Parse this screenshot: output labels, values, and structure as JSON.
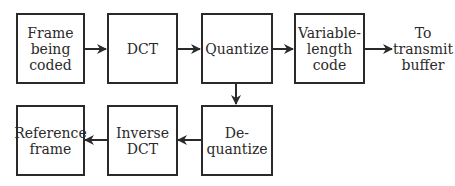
{
  "diagram": {
    "title": "",
    "nodes": [
      {
        "id": "frame",
        "label": "Frame\nbeing\ncoded"
      },
      {
        "id": "dct",
        "label": "DCT"
      },
      {
        "id": "quantize",
        "label": "Quantize"
      },
      {
        "id": "vlc",
        "label": "Variable-\nlength\ncode"
      },
      {
        "id": "output",
        "label": "To\ntransmit\nbuffer"
      },
      {
        "id": "dequantize",
        "label": "De-\nquantize"
      },
      {
        "id": "idct",
        "label": "Inverse\nDCT"
      },
      {
        "id": "reference",
        "label": "Reference\nframe"
      }
    ],
    "edges": [
      {
        "from": "frame",
        "to": "dct"
      },
      {
        "from": "dct",
        "to": "quantize"
      },
      {
        "from": "quantize",
        "to": "vlc"
      },
      {
        "from": "vlc",
        "to": "output"
      },
      {
        "from": "quantize",
        "to": "dequantize"
      },
      {
        "from": "dequantize",
        "to": "idct"
      },
      {
        "from": "idct",
        "to": "reference"
      }
    ]
  }
}
